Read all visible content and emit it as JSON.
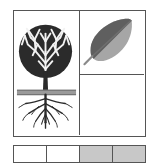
{
  "emblem": {
    "title": "Tree and leaf emblem",
    "frame_color": "#555555",
    "background_color": "#ffffff"
  },
  "panels": [
    {
      "name": "tree-panel",
      "content": "tree-with-roots",
      "description": "Deciduous tree with dense round canopy above a horizontal ground line and spreading root system below",
      "canopy_color": "#2b2b2b",
      "trunk_color": "#2b2b2b",
      "ground_color": "#9a9a9a",
      "root_color": "#2b2b2b"
    },
    {
      "name": "leaf-panel",
      "content": "two-tone-leaf",
      "description": "Single leaf tilted with tip to upper right, dark upper half and lighter lower half separated by a midrib",
      "leaf_dark_color": "#5f5f5f",
      "leaf_light_color": "#a6a6a6",
      "midrib_color": "#6e6e6e",
      "stem_color": "#8a8a8a"
    },
    {
      "name": "blank-panel",
      "content": "empty",
      "description": "Empty white panel",
      "fill_color": "#ffffff"
    }
  ],
  "swatch_strip": {
    "name": "color-swatch-strip",
    "swatches": [
      {
        "label": "swatch-1",
        "color": "#ffffff"
      },
      {
        "label": "swatch-2",
        "color": "#ffffff"
      },
      {
        "label": "swatch-3",
        "color": "#c8c8c8"
      },
      {
        "label": "swatch-4",
        "color": "#c8c8c8"
      }
    ]
  }
}
